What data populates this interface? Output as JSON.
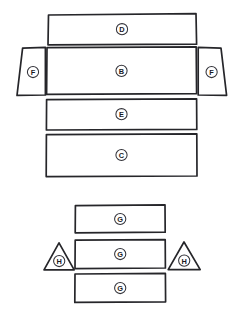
{
  "diagram": {
    "background_color": "#ffffff",
    "line_color": "#26262a",
    "label_color": "#1b1b1f",
    "width": 241,
    "height": 311,
    "groups": [
      {
        "name": "upper-assembly",
        "parts": [
          {
            "label": "D",
            "shape": "rectangle",
            "cx": 122,
            "cy": 29
          },
          {
            "label": "F",
            "shape": "trapezoid-left",
            "cx": 32,
            "cy": 72
          },
          {
            "label": "B",
            "shape": "rectangle",
            "cx": 121,
            "cy": 71
          },
          {
            "label": "F",
            "shape": "trapezoid-right",
            "cx": 213,
            "cy": 72
          },
          {
            "label": "E",
            "shape": "rectangle",
            "cx": 121,
            "cy": 114
          },
          {
            "label": "C",
            "shape": "rectangle",
            "cx": 121,
            "cy": 155
          }
        ]
      },
      {
        "name": "lower-assembly",
        "parts": [
          {
            "label": "G",
            "shape": "rectangle",
            "cx": 120,
            "cy": 219
          },
          {
            "label": "H",
            "shape": "triangle-left",
            "cx": 59,
            "cy": 260
          },
          {
            "label": "G",
            "shape": "rectangle",
            "cx": 120,
            "cy": 254
          },
          {
            "label": "H",
            "shape": "triangle-right",
            "cx": 184,
            "cy": 260
          },
          {
            "label": "G",
            "shape": "rectangle",
            "cx": 120,
            "cy": 288
          }
        ]
      }
    ]
  }
}
